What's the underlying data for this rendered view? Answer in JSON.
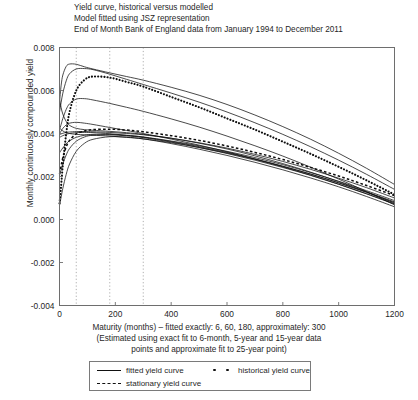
{
  "title": {
    "line1": "Yield curve, historical versus modelled",
    "line2": "Model fitted using JSZ representation",
    "line3": "End of Month Bank of England data from January 1994 to December 2011"
  },
  "axes": {
    "ylabel": "Monthly continuously compounded yield",
    "xlabel_line1": "Maturity (months) – fitted exactly: 6, 60, 180, approximately: 300",
    "xlabel_line2": "(Estimated using exact fit to 6-month, 5-year and 15-year data",
    "xlabel_line3": "points and approximate fit to 25-year point)",
    "x_ticks": [
      "0",
      "200",
      "400",
      "600",
      "800",
      "1000",
      "1200"
    ],
    "y_ticks": [
      "0.008",
      "0.006",
      "0.004",
      "0.002",
      "0.000",
      "-0.002",
      "-0.004"
    ]
  },
  "legend": {
    "fitted": "fitted yield curve",
    "historical": "historical yield curve",
    "stationary": "stationary yield curve"
  },
  "chart_data": {
    "type": "line",
    "title": "Yield curve, historical versus modelled",
    "subtitle": "Model fitted using JSZ representation; End of Month Bank of England data from January 1994 to December 2011",
    "xlabel": "Maturity (months)",
    "ylabel": "Monthly continuously compounded yield",
    "xlim": [
      0,
      1200
    ],
    "ylim": [
      -0.004,
      0.008
    ],
    "xticks": [
      0,
      200,
      400,
      600,
      800,
      1000,
      1200
    ],
    "yticks": [
      -0.004,
      -0.002,
      0.0,
      0.002,
      0.004,
      0.006,
      0.008
    ],
    "grid": "vertical dotted reference lines at maturities 60, 180, 300",
    "gridlines_x": [
      60,
      180,
      300
    ],
    "legend_position": "below axes, outside",
    "x": [
      0,
      6,
      12,
      24,
      36,
      60,
      90,
      120,
      180,
      240,
      300,
      400,
      500,
      600,
      700,
      800,
      900,
      1000,
      1100,
      1200
    ],
    "series": [
      {
        "name": "fitted yield curve 1",
        "style": "solid",
        "values": [
          0.00545,
          0.00625,
          0.00672,
          0.00712,
          0.00723,
          0.00722,
          0.0071,
          0.007,
          0.00682,
          0.00665,
          0.00648,
          0.00615,
          0.00578,
          0.00535,
          0.00486,
          0.00432,
          0.00373,
          0.00308,
          0.00238,
          0.00163
        ]
      },
      {
        "name": "fitted yield curve 2",
        "style": "solid",
        "values": [
          0.005,
          0.00545,
          0.00588,
          0.00645,
          0.00678,
          0.007,
          0.00702,
          0.00697,
          0.00676,
          0.00652,
          0.00628,
          0.00588,
          0.00546,
          0.005,
          0.0045,
          0.00396,
          0.00338,
          0.00276,
          0.0021,
          0.0014
        ]
      },
      {
        "name": "fitted yield curve 3",
        "style": "solid",
        "values": [
          0.00418,
          0.00443,
          0.0047,
          0.00512,
          0.00538,
          0.0056,
          0.00562,
          0.00556,
          0.0054,
          0.00522,
          0.00503,
          0.00468,
          0.0043,
          0.00388,
          0.00343,
          0.00295,
          0.00243,
          0.00188,
          0.0013,
          0.00068
        ]
      },
      {
        "name": "fitted yield curve 4",
        "style": "solid",
        "values": [
          0.0056,
          0.0052,
          0.0049,
          0.00456,
          0.00438,
          0.00424,
          0.00418,
          0.00415,
          0.0041,
          0.00404,
          0.00396,
          0.00378,
          0.00355,
          0.00328,
          0.00296,
          0.0026,
          0.0022,
          0.00176,
          0.00128,
          0.00076
        ]
      },
      {
        "name": "fitted yield curve 5",
        "style": "solid",
        "values": [
          0.00395,
          0.00398,
          0.00401,
          0.00405,
          0.00407,
          0.00409,
          0.00409,
          0.00408,
          0.00405,
          0.004,
          0.00394,
          0.00378,
          0.00357,
          0.00332,
          0.00303,
          0.0027,
          0.00233,
          0.00192,
          0.00148,
          0.001
        ]
      },
      {
        "name": "fitted yield curve 6",
        "style": "solid",
        "values": [
          0.00382,
          0.00386,
          0.0039,
          0.00396,
          0.004,
          0.00404,
          0.00405,
          0.00404,
          0.00399,
          0.00392,
          0.00384,
          0.00365,
          0.00343,
          0.00317,
          0.00288,
          0.00255,
          0.00218,
          0.00178,
          0.00134,
          0.00088
        ]
      },
      {
        "name": "fitted yield curve 7",
        "style": "solid",
        "values": [
          0.00425,
          0.00418,
          0.00412,
          0.00404,
          0.004,
          0.00396,
          0.00394,
          0.00392,
          0.00388,
          0.00382,
          0.00375,
          0.00357,
          0.00335,
          0.00309,
          0.0028,
          0.00247,
          0.00211,
          0.00171,
          0.00128,
          0.00082
        ]
      },
      {
        "name": "fitted yield curve 8",
        "style": "solid",
        "values": [
          0.0031,
          0.00322,
          0.00333,
          0.00352,
          0.00366,
          0.00382,
          0.00392,
          0.00396,
          0.00396,
          0.00391,
          0.00383,
          0.00363,
          0.00339,
          0.00312,
          0.00282,
          0.00248,
          0.00211,
          0.0017,
          0.00126,
          0.00079
        ]
      },
      {
        "name": "fitted yield curve 9",
        "style": "solid",
        "values": [
          0.00205,
          0.00232,
          0.00258,
          0.003,
          0.0033,
          0.00364,
          0.00384,
          0.00392,
          0.00394,
          0.00389,
          0.00381,
          0.0036,
          0.00335,
          0.00307,
          0.00276,
          0.00242,
          0.00205,
          0.00164,
          0.0012,
          0.00073
        ]
      },
      {
        "name": "fitted yield curve 10",
        "style": "solid",
        "values": [
          0.00065,
          0.00105,
          0.00145,
          0.0021,
          0.00258,
          0.00317,
          0.00355,
          0.00373,
          0.00385,
          0.00383,
          0.00375,
          0.00353,
          0.00327,
          0.00298,
          0.00266,
          0.00231,
          0.00193,
          0.00152,
          0.00107,
          0.00059
        ]
      },
      {
        "name": "fitted yield curve 11",
        "style": "solid",
        "values": [
          0.00398,
          0.00412,
          0.00424,
          0.0044,
          0.00448,
          0.00452,
          0.00448,
          0.00442,
          0.00428,
          0.00414,
          0.004,
          0.00374,
          0.00346,
          0.00315,
          0.00281,
          0.00245,
          0.00206,
          0.00164,
          0.00119,
          0.00071
        ]
      },
      {
        "name": "historical yield curve",
        "style": "dotted",
        "values": [
          0.00075,
          0.0016,
          0.00255,
          0.004,
          0.005,
          0.006,
          0.0065,
          0.00665,
          0.0066,
          0.0064,
          0.00618,
          0.0057,
          0.00522,
          0.0047,
          0.00418,
          0.00362,
          0.00305,
          0.00245,
          0.00182,
          0.00116
        ]
      },
      {
        "name": "stationary yield curve",
        "style": "dashed",
        "values": [
          0.00212,
          0.00252,
          0.00288,
          0.00338,
          0.00368,
          0.00398,
          0.00412,
          0.00418,
          0.0042,
          0.00416,
          0.00408,
          0.0039,
          0.00368,
          0.00342,
          0.00312,
          0.00279,
          0.00242,
          0.00202,
          0.00158,
          0.00111
        ]
      }
    ]
  }
}
